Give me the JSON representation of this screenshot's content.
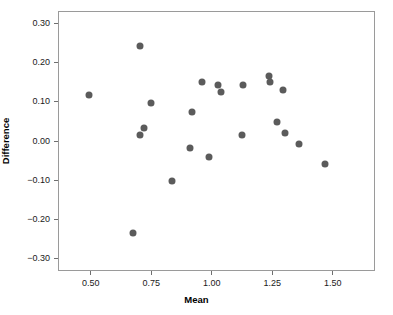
{
  "chart_data": {
    "type": "scatter",
    "title": "",
    "xlabel": "Mean",
    "ylabel": "Difference",
    "xlim": [
      0.365,
      1.675
    ],
    "ylim": [
      -0.333,
      0.333
    ],
    "grid": false,
    "legend": null,
    "xticks": [
      0.5,
      0.75,
      1.0,
      1.25,
      1.5
    ],
    "xtick_labels": [
      "0.50",
      "0.75",
      "1.00",
      "1.25",
      "1.50"
    ],
    "yticks": [
      0.3,
      0.2,
      0.1,
      0.0,
      -0.1,
      -0.2,
      -0.3
    ],
    "ytick_labels": [
      "0.30",
      "0.20",
      "0.10",
      "0.00",
      "−0.10",
      "−0.20",
      "−0.30"
    ],
    "marker": {
      "shape": "circle",
      "color": "#5b5b5b",
      "size_px": 7
    },
    "points": [
      {
        "x": 0.487,
        "y": 0.12
      },
      {
        "x": 0.67,
        "y": -0.234
      },
      {
        "x": 0.699,
        "y": 0.247
      },
      {
        "x": 0.7,
        "y": 0.018
      },
      {
        "x": 0.717,
        "y": 0.035
      },
      {
        "x": 0.745,
        "y": 0.099
      },
      {
        "x": 0.83,
        "y": -0.101
      },
      {
        "x": 0.906,
        "y": -0.016
      },
      {
        "x": 0.915,
        "y": 0.077
      },
      {
        "x": 0.955,
        "y": 0.153
      },
      {
        "x": 0.983,
        "y": -0.038
      },
      {
        "x": 1.021,
        "y": 0.145
      },
      {
        "x": 1.036,
        "y": 0.128
      },
      {
        "x": 1.12,
        "y": 0.017
      },
      {
        "x": 1.124,
        "y": 0.145
      },
      {
        "x": 1.233,
        "y": 0.168
      },
      {
        "x": 1.237,
        "y": 0.153
      },
      {
        "x": 1.267,
        "y": 0.051
      },
      {
        "x": 1.289,
        "y": 0.133
      },
      {
        "x": 1.3,
        "y": 0.023
      },
      {
        "x": 1.357,
        "y": -0.006
      },
      {
        "x": 1.464,
        "y": -0.057
      }
    ]
  }
}
